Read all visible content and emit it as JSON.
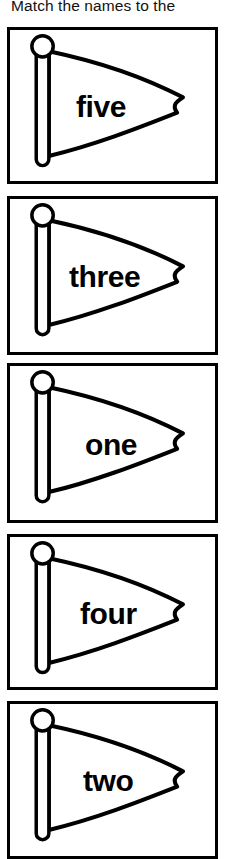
{
  "header": {
    "text": "Match the names to the",
    "clipped_at_top": true
  },
  "colors": {
    "ink": "#000000",
    "paper": "#ffffff",
    "header_text": "#111111"
  },
  "worksheet": {
    "card_count": 5,
    "last_card_clipped_at_bottom": true
  },
  "cards": [
    {
      "label": "five",
      "icon": "pennant-flag-icon",
      "top": 27,
      "height": 157,
      "label_left": 73,
      "label_top": 89
    },
    {
      "label": "three",
      "icon": "pennant-flag-icon",
      "top": 196,
      "height": 159,
      "label_left": 66,
      "label_top": 259
    },
    {
      "label": "one",
      "icon": "pennant-flag-icon",
      "top": 363,
      "height": 160,
      "label_left": 82,
      "label_top": 427
    },
    {
      "label": "four",
      "icon": "pennant-flag-icon",
      "top": 534,
      "height": 156,
      "label_left": 77,
      "label_top": 596
    },
    {
      "label": "two",
      "icon": "pennant-flag-icon",
      "top": 701,
      "height": 158,
      "label_left": 80,
      "label_top": 763
    }
  ]
}
